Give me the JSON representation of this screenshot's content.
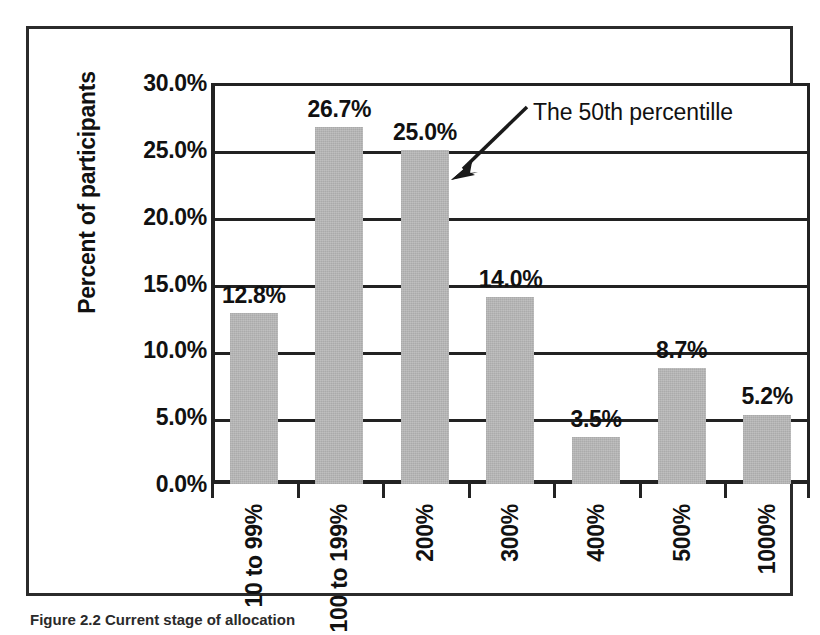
{
  "figure": {
    "caption": "Figure 2.2  Current stage of allocation",
    "annotation": {
      "label": "The 50th percentille",
      "arrow_icon": "arrow-down-left-icon"
    }
  },
  "chart_data": {
    "type": "bar",
    "title": "",
    "xlabel": "",
    "ylabel": "Percent of participants",
    "categories": [
      "10 to 99%",
      "100 to 199%",
      "200%",
      "300%",
      "400%",
      "500%",
      "1000%"
    ],
    "values": [
      12.8,
      26.7,
      25.0,
      14.0,
      3.5,
      8.7,
      5.2
    ],
    "value_labels": [
      "12.8%",
      "26.7%",
      "25.0%",
      "14.0%",
      "3.5%",
      "8.7%",
      "5.2%"
    ],
    "ylim": [
      0,
      30
    ],
    "ytick_values": [
      0,
      5,
      10,
      15,
      20,
      25,
      30
    ],
    "ytick_labels": [
      "0.0%",
      "5.0%",
      "10.0%",
      "15.0%",
      "20.0%",
      "25.0%",
      "30.0%"
    ],
    "grid": true,
    "grid_axis": "y",
    "legend": null,
    "bar_color": "#b9b9b9",
    "axis_color": "#222222",
    "annotations": [
      {
        "text": "The 50th percentille",
        "points_to_category": "200%",
        "points_to_value": 25.0
      }
    ]
  }
}
